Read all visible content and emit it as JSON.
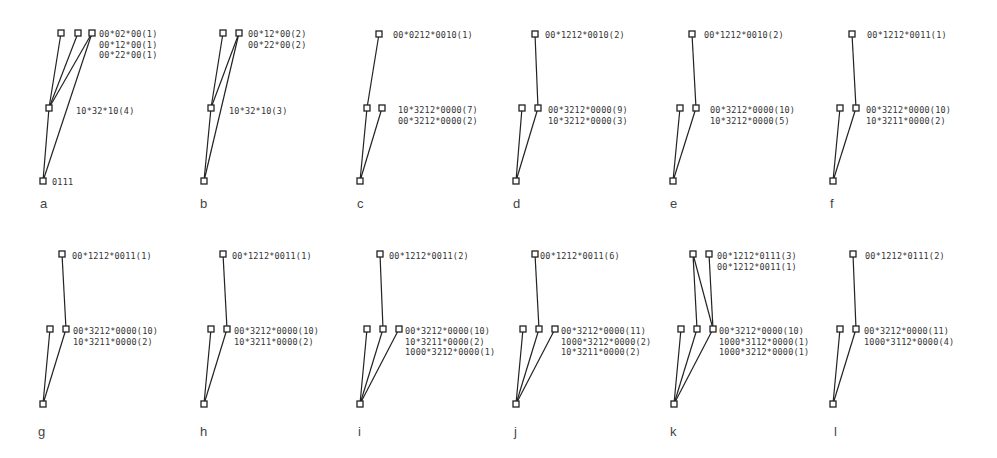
{
  "figure": {
    "panels": [
      {
        "letter": "a",
        "nodes": {
          "top": [
            [
              61,
              33
            ],
            [
              78,
              33
            ],
            [
              92,
              33
            ]
          ],
          "mid": [
            [
              49,
              108
            ]
          ],
          "bottom": [
            [
              43,
              181
            ]
          ]
        },
        "edges": [
          [
            [
              61,
              33
            ],
            [
              49,
              108
            ]
          ],
          [
            [
              78,
              33
            ],
            [
              49,
              108
            ]
          ],
          [
            [
              92,
              33
            ],
            [
              49,
              108
            ]
          ],
          [
            [
              92,
              33
            ],
            [
              43,
              181
            ]
          ],
          [
            [
              49,
              108
            ],
            [
              43,
              181
            ]
          ]
        ],
        "top_labels": [
          "00*02*00(1)",
          "00*12*00(1)",
          "00*22*00(1)"
        ],
        "top_label_pos": [
          99,
          29
        ],
        "mid_labels": [
          "10*32*10(4)"
        ],
        "mid_label_pos": [
          76,
          106
        ],
        "bottom_label": "0111",
        "bottom_label_pos": [
          52,
          177
        ],
        "letter_pos": [
          40,
          196
        ]
      },
      {
        "letter": "b",
        "nodes": {
          "top": [
            [
              223,
              33
            ],
            [
              239,
              33
            ]
          ],
          "mid": [
            [
              211,
              108
            ]
          ],
          "bottom": [
            [
              204,
              181
            ]
          ]
        },
        "edges": [
          [
            [
              223,
              33
            ],
            [
              211,
              108
            ]
          ],
          [
            [
              239,
              33
            ],
            [
              211,
              108
            ]
          ],
          [
            [
              239,
              33
            ],
            [
              204,
              181
            ]
          ],
          [
            [
              211,
              108
            ],
            [
              204,
              181
            ]
          ]
        ],
        "top_labels": [
          "00*12*00(2)",
          "00*22*00(2)"
        ],
        "top_label_pos": [
          248,
          29
        ],
        "mid_labels": [
          "10*32*10(3)"
        ],
        "mid_label_pos": [
          229,
          106
        ],
        "letter_pos": [
          200,
          196
        ]
      },
      {
        "letter": "c",
        "nodes": {
          "top": [
            [
              379,
              34
            ]
          ],
          "mid": [
            [
              367,
              108
            ],
            [
              382,
              108
            ]
          ],
          "bottom": [
            [
              360,
              181
            ]
          ]
        },
        "edges": [
          [
            [
              379,
              34
            ],
            [
              367,
              108
            ]
          ],
          [
            [
              367,
              108
            ],
            [
              360,
              181
            ]
          ],
          [
            [
              382,
              108
            ],
            [
              360,
              181
            ]
          ]
        ],
        "top_labels": [
          "00*0212*0010(1)"
        ],
        "top_label_pos": [
          393,
          30
        ],
        "mid_labels": [
          "10*3212*0000(7)",
          "00*3212*0000(2)"
        ],
        "mid_label_pos": [
          398,
          105
        ],
        "letter_pos": [
          357,
          196
        ]
      },
      {
        "letter": "d",
        "nodes": {
          "top": [
            [
              535,
              34
            ]
          ],
          "mid": [
            [
              522,
              108
            ],
            [
              538,
              108
            ]
          ],
          "bottom": [
            [
              516,
              181
            ]
          ]
        },
        "edges": [
          [
            [
              535,
              34
            ],
            [
              538,
              108
            ]
          ],
          [
            [
              522,
              108
            ],
            [
              516,
              181
            ]
          ],
          [
            [
              538,
              108
            ],
            [
              516,
              181
            ]
          ]
        ],
        "top_labels": [
          "00*1212*0010(2)"
        ],
        "top_label_pos": [
          545,
          30
        ],
        "mid_labels": [
          "00*3212*0000(9)",
          "10*3212*0000(3)"
        ],
        "mid_label_pos": [
          548,
          105
        ],
        "letter_pos": [
          513,
          196
        ]
      },
      {
        "letter": "e",
        "nodes": {
          "top": [
            [
              692,
              34
            ]
          ],
          "mid": [
            [
              680,
              108
            ],
            [
              696,
              108
            ]
          ],
          "bottom": [
            [
              673,
              181
            ]
          ]
        },
        "edges": [
          [
            [
              692,
              34
            ],
            [
              696,
              108
            ]
          ],
          [
            [
              680,
              108
            ],
            [
              673,
              181
            ]
          ],
          [
            [
              696,
              108
            ],
            [
              673,
              181
            ]
          ]
        ],
        "top_labels": [
          "00*1212*0010(2)"
        ],
        "top_label_pos": [
          704,
          30
        ],
        "mid_labels": [
          "00*3212*0000(10)",
          "10*3212*0000(5)"
        ],
        "mid_label_pos": [
          710,
          105
        ],
        "letter_pos": [
          670,
          196
        ]
      },
      {
        "letter": "f",
        "nodes": {
          "top": [
            [
              852,
              34
            ]
          ],
          "mid": [
            [
              840,
              108
            ],
            [
              856,
              108
            ]
          ],
          "bottom": [
            [
              833,
              181
            ]
          ]
        },
        "edges": [
          [
            [
              852,
              34
            ],
            [
              856,
              108
            ]
          ],
          [
            [
              840,
              108
            ],
            [
              833,
              181
            ]
          ],
          [
            [
              856,
              108
            ],
            [
              833,
              181
            ]
          ]
        ],
        "top_labels": [
          "00*1212*0011(1)"
        ],
        "top_label_pos": [
          867,
          30
        ],
        "mid_labels": [
          "00*3212*0000(10)",
          "10*3211*0000(2)"
        ],
        "mid_label_pos": [
          866,
          105
        ],
        "letter_pos": [
          830,
          196
        ]
      },
      {
        "letter": "g",
        "nodes": {
          "top": [
            [
              62,
              254
            ]
          ],
          "mid": [
            [
              50,
              329
            ],
            [
              66,
              329
            ]
          ],
          "bottom": [
            [
              43,
              404
            ]
          ]
        },
        "edges": [
          [
            [
              62,
              254
            ],
            [
              66,
              329
            ]
          ],
          [
            [
              50,
              329
            ],
            [
              43,
              404
            ]
          ],
          [
            [
              66,
              329
            ],
            [
              43,
              404
            ]
          ]
        ],
        "top_labels": [
          "00*1212*0011(1)"
        ],
        "top_label_pos": [
          72,
          251
        ],
        "mid_labels": [
          "00*3212*0000(10)",
          "10*3211*0000(2)"
        ],
        "mid_label_pos": [
          73,
          326
        ],
        "letter_pos": [
          38,
          424
        ]
      },
      {
        "letter": "h",
        "nodes": {
          "top": [
            [
              223,
              254
            ]
          ],
          "mid": [
            [
              211,
              329
            ],
            [
              227,
              329
            ]
          ],
          "bottom": [
            [
              204,
              404
            ]
          ]
        },
        "edges": [
          [
            [
              223,
              254
            ],
            [
              227,
              329
            ]
          ],
          [
            [
              211,
              329
            ],
            [
              204,
              404
            ]
          ],
          [
            [
              227,
              329
            ],
            [
              204,
              404
            ]
          ]
        ],
        "top_labels": [
          "00*1212*0011(1)"
        ],
        "top_label_pos": [
          232,
          251
        ],
        "mid_labels": [
          "00*3212*0000(10)",
          "10*3211*0000(2)"
        ],
        "mid_label_pos": [
          234,
          326
        ],
        "letter_pos": [
          200,
          424
        ]
      },
      {
        "letter": "i",
        "nodes": {
          "top": [
            [
              380,
              254
            ]
          ],
          "mid": [
            [
              367,
              329
            ],
            [
              383,
              329
            ],
            [
              399,
              329
            ]
          ],
          "bottom": [
            [
              360,
              404
            ]
          ]
        },
        "edges": [
          [
            [
              380,
              254
            ],
            [
              383,
              329
            ]
          ],
          [
            [
              367,
              329
            ],
            [
              360,
              404
            ]
          ],
          [
            [
              383,
              329
            ],
            [
              360,
              404
            ]
          ],
          [
            [
              399,
              329
            ],
            [
              360,
              404
            ]
          ]
        ],
        "top_labels": [
          "00*1212*0011(2)"
        ],
        "top_label_pos": [
          389,
          251
        ],
        "mid_labels": [
          "00*3212*0000(10)",
          "10*3211*0000(2)",
          "1000*3212*0000(1)"
        ],
        "mid_label_pos": [
          405,
          326
        ],
        "letter_pos": [
          358,
          424
        ]
      },
      {
        "letter": "j",
        "nodes": {
          "top": [
            [
              535,
              254
            ]
          ],
          "mid": [
            [
              523,
              329
            ],
            [
              539,
              329
            ],
            [
              555,
              329
            ]
          ],
          "bottom": [
            [
              516,
              404
            ]
          ]
        },
        "edges": [
          [
            [
              535,
              254
            ],
            [
              539,
              329
            ]
          ],
          [
            [
              523,
              329
            ],
            [
              516,
              404
            ]
          ],
          [
            [
              539,
              329
            ],
            [
              516,
              404
            ]
          ],
          [
            [
              555,
              329
            ],
            [
              516,
              404
            ]
          ]
        ],
        "top_labels": [
          "00*1212*0011(6)"
        ],
        "top_label_pos": [
          540,
          251
        ],
        "mid_labels": [
          "00*3212*0000(11)",
          "1000*3212*0000(2)",
          "10*3211*0000(2)"
        ],
        "mid_label_pos": [
          561,
          326
        ],
        "letter_pos": [
          514,
          424
        ]
      },
      {
        "letter": "k",
        "nodes": {
          "top": [
            [
              693,
              254
            ],
            [
              709,
              254
            ]
          ],
          "mid": [
            [
              681,
              329
            ],
            [
              697,
              329
            ],
            [
              713,
              329
            ]
          ],
          "bottom": [
            [
              674,
              404
            ]
          ]
        },
        "edges": [
          [
            [
              693,
              254
            ],
            [
              697,
              329
            ]
          ],
          [
            [
              693,
              254
            ],
            [
              713,
              329
            ]
          ],
          [
            [
              709,
              254
            ],
            [
              713,
              329
            ]
          ],
          [
            [
              681,
              329
            ],
            [
              674,
              404
            ]
          ],
          [
            [
              697,
              329
            ],
            [
              674,
              404
            ]
          ],
          [
            [
              713,
              329
            ],
            [
              674,
              404
            ]
          ]
        ],
        "top_labels": [
          "00*1212*0111(3)",
          "00*1212*0011(1)"
        ],
        "top_label_pos": [
          717,
          251
        ],
        "mid_labels": [
          "00*3212*0000(10)",
          "1000*3112*0000(1)",
          "1000*3212*0000(1)"
        ],
        "mid_label_pos": [
          719,
          326
        ],
        "letter_pos": [
          670,
          424
        ]
      },
      {
        "letter": "l",
        "nodes": {
          "top": [
            [
              853,
              254
            ]
          ],
          "mid": [
            [
              840,
              329
            ],
            [
              856,
              329
            ]
          ],
          "bottom": [
            [
              833,
              404
            ]
          ]
        },
        "edges": [
          [
            [
              853,
              254
            ],
            [
              856,
              329
            ]
          ],
          [
            [
              840,
              329
            ],
            [
              833,
              404
            ]
          ],
          [
            [
              856,
              329
            ],
            [
              833,
              404
            ]
          ]
        ],
        "top_labels": [
          "00*1212*0111(2)"
        ],
        "top_label_pos": [
          865,
          251
        ],
        "mid_labels": [
          "00*3212*0000(11)",
          "1000*3112*0000(4)"
        ],
        "mid_label_pos": [
          864,
          326
        ],
        "letter_pos": [
          834,
          424
        ]
      }
    ]
  }
}
